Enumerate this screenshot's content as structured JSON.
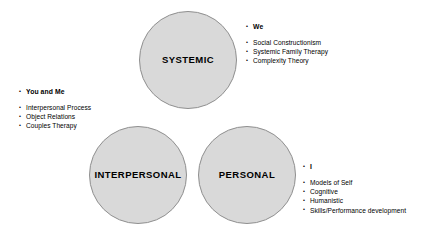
{
  "diagram": {
    "circles": [
      {
        "id": "systemic",
        "label": "SYSTEMIC",
        "fill": "#d9d9d9",
        "stroke": "#8f8f8f"
      },
      {
        "id": "interpersonal",
        "label": "INTERPERSONAL",
        "fill": "#d9d9d9",
        "stroke": "#8f8f8f"
      },
      {
        "id": "personal",
        "label": "PERSONAL",
        "fill": "#d9d9d9",
        "stroke": "#8f8f8f"
      }
    ],
    "annotations": [
      {
        "id": "we",
        "heading": "We",
        "items": [
          "Social Constructionism",
          "Systemic Family Therapy",
          "Complexity Theory"
        ]
      },
      {
        "id": "you-and-me",
        "heading": "You and Me",
        "items": [
          "Interpersonal Process",
          "Object Relations",
          "Couples Therapy"
        ]
      },
      {
        "id": "i",
        "heading": "I",
        "items": [
          "Models of Self",
          "Cognitive",
          "Humanistic",
          "Skills/Performance development"
        ]
      }
    ]
  }
}
